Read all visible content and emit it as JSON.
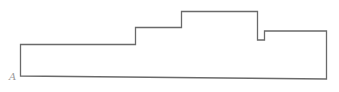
{
  "diagram": {
    "type": "stepped-outline",
    "stroke_color": "#6a6a6a",
    "label_color": "#9a9a9a",
    "labels": [
      {
        "id": "A",
        "text": "A",
        "anchor": "bottom-left-vertex"
      }
    ]
  }
}
